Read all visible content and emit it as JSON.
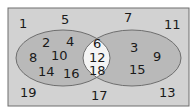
{
  "diagram": {
    "type": "venn",
    "colors": {
      "universe_fill": "#d2d2d2",
      "set_fill": "#b9b9b9",
      "intersection_fill": "#f4f4f4",
      "outline": "#6e6e6e"
    },
    "outside": [
      "1",
      "5",
      "7",
      "11",
      "19",
      "17",
      "13"
    ],
    "left_only": [
      "2",
      "4",
      "8",
      "10",
      "14",
      "16"
    ],
    "intersection": [
      "6",
      "12",
      "18"
    ],
    "right_only": [
      "3",
      "9",
      "15"
    ]
  }
}
